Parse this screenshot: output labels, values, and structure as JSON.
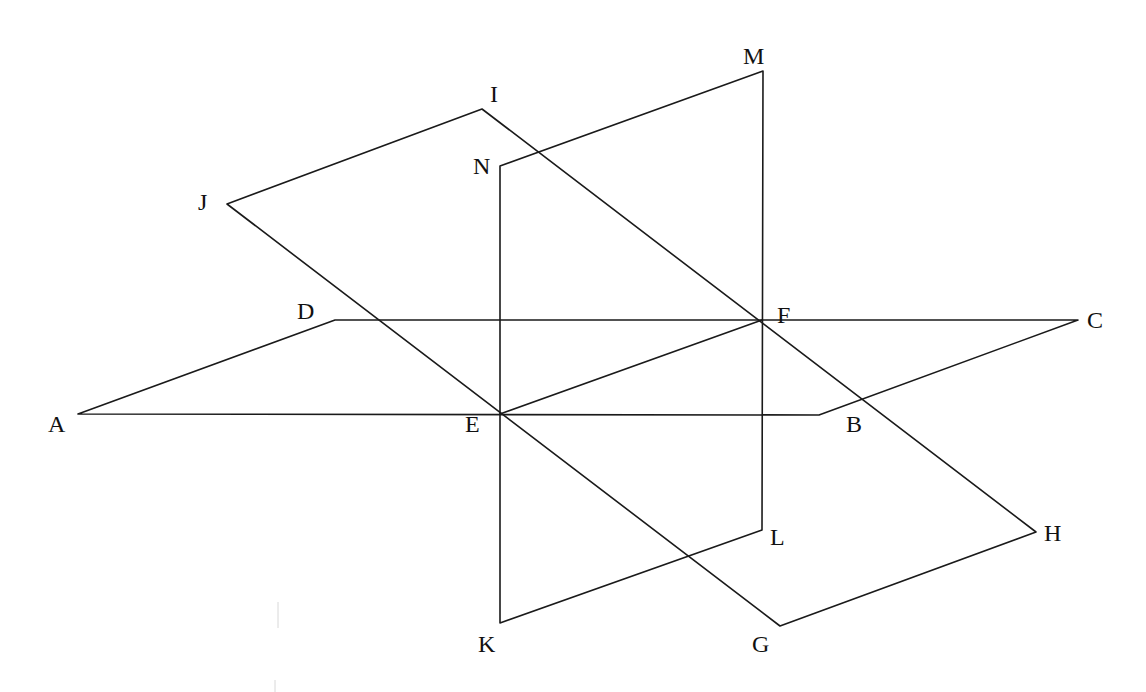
{
  "diagram": {
    "points": {
      "A": {
        "x": 78,
        "y": 414
      },
      "B": {
        "x": 819,
        "y": 415
      },
      "C": {
        "x": 1078,
        "y": 320
      },
      "D": {
        "x": 335,
        "y": 320
      },
      "E": {
        "x": 500,
        "y": 414
      },
      "F": {
        "x": 762,
        "y": 320
      },
      "G": {
        "x": 780,
        "y": 626
      },
      "H": {
        "x": 1036,
        "y": 532
      },
      "I": {
        "x": 482,
        "y": 109
      },
      "J": {
        "x": 227,
        "y": 204
      },
      "K": {
        "x": 500,
        "y": 623
      },
      "L": {
        "x": 762,
        "y": 530
      },
      "M": {
        "x": 763,
        "y": 71
      },
      "N": {
        "x": 500,
        "y": 166
      }
    },
    "planes": [
      {
        "name": "ABCD",
        "vertices": [
          "A",
          "B",
          "C",
          "D"
        ]
      },
      {
        "name": "GHIJ",
        "vertices": [
          "G",
          "H",
          "I",
          "J"
        ]
      },
      {
        "name": "KLMN",
        "vertices": [
          "K",
          "L",
          "M",
          "N"
        ]
      }
    ],
    "segments": [
      [
        "E",
        "F"
      ]
    ],
    "labels": [
      {
        "text": "A",
        "x": 48,
        "y": 432
      },
      {
        "text": "B",
        "x": 846,
        "y": 432
      },
      {
        "text": "C",
        "x": 1087,
        "y": 328
      },
      {
        "text": "D",
        "x": 297,
        "y": 319
      },
      {
        "text": "E",
        "x": 465,
        "y": 432
      },
      {
        "text": "F",
        "x": 777,
        "y": 323
      },
      {
        "text": "G",
        "x": 752,
        "y": 652
      },
      {
        "text": "H",
        "x": 1044,
        "y": 541
      },
      {
        "text": "I",
        "x": 490,
        "y": 102
      },
      {
        "text": "J",
        "x": 198,
        "y": 210
      },
      {
        "text": "K",
        "x": 478,
        "y": 652
      },
      {
        "text": "L",
        "x": 770,
        "y": 545
      },
      {
        "text": "M",
        "x": 743,
        "y": 64
      },
      {
        "text": "N",
        "x": 473,
        "y": 174
      }
    ]
  }
}
